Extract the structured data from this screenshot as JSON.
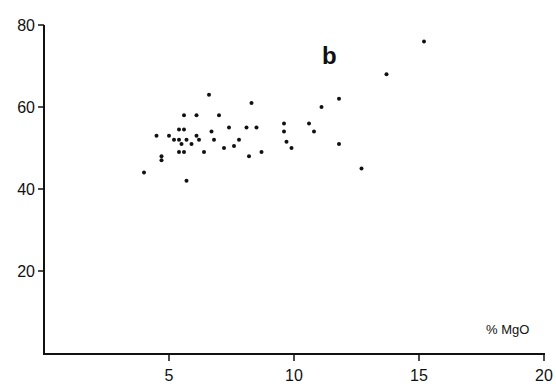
{
  "chart_data": {
    "type": "scatter",
    "title": "",
    "panel_label": "b",
    "xlabel": "% MgO",
    "ylabel": "",
    "xlim": [
      0,
      20
    ],
    "ylim": [
      0,
      80
    ],
    "x_ticks": [
      5,
      10,
      15,
      20
    ],
    "y_ticks": [
      20,
      40,
      60,
      80
    ],
    "grid": false,
    "legend": null,
    "marker_color": "#111111",
    "points": [
      [
        4.0,
        44
      ],
      [
        4.5,
        53
      ],
      [
        4.7,
        48
      ],
      [
        4.7,
        47
      ],
      [
        5.0,
        53
      ],
      [
        5.2,
        52
      ],
      [
        5.4,
        52
      ],
      [
        5.4,
        54.5
      ],
      [
        5.6,
        54.5
      ],
      [
        5.5,
        51
      ],
      [
        5.4,
        49
      ],
      [
        5.6,
        49
      ],
      [
        5.6,
        58
      ],
      [
        5.7,
        52
      ],
      [
        5.7,
        42
      ],
      [
        5.9,
        51
      ],
      [
        6.1,
        58
      ],
      [
        6.1,
        53
      ],
      [
        6.2,
        52
      ],
      [
        6.4,
        49
      ],
      [
        6.6,
        63
      ],
      [
        6.7,
        54
      ],
      [
        6.8,
        52
      ],
      [
        7.0,
        58
      ],
      [
        7.2,
        50
      ],
      [
        7.4,
        55
      ],
      [
        7.6,
        50.5
      ],
      [
        7.8,
        52
      ],
      [
        8.1,
        55
      ],
      [
        8.2,
        48
      ],
      [
        8.3,
        61
      ],
      [
        8.5,
        55
      ],
      [
        8.7,
        49
      ],
      [
        9.6,
        56
      ],
      [
        9.6,
        54
      ],
      [
        9.7,
        51.5
      ],
      [
        9.9,
        50
      ],
      [
        10.6,
        56
      ],
      [
        10.8,
        54
      ],
      [
        11.1,
        60
      ],
      [
        11.8,
        62
      ],
      [
        11.8,
        51
      ],
      [
        12.7,
        45
      ],
      [
        13.7,
        68
      ],
      [
        15.2,
        76
      ]
    ]
  }
}
